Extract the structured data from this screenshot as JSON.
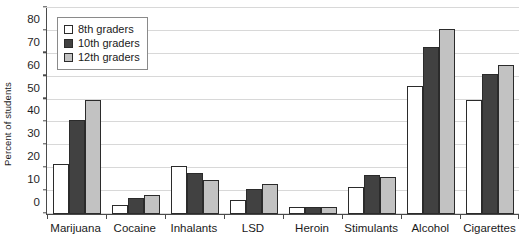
{
  "chart_data": {
    "type": "bar",
    "title": "",
    "xlabel": "",
    "ylabel": "Percent of students",
    "ylim": [
      0,
      90
    ],
    "yticks": [
      0,
      10,
      20,
      30,
      40,
      50,
      60,
      70,
      80,
      90
    ],
    "grid": true,
    "legend_position": "top-left",
    "categories": [
      "Marijuana",
      "Cocaine",
      "Inhalants",
      "LSD",
      "Heroin",
      "Stimulants",
      "Alcohol",
      "Cigarettes"
    ],
    "series": [
      {
        "name": "8th graders",
        "color": "#ffffff",
        "values": [
          22,
          4,
          21,
          6,
          3,
          12,
          56,
          50
        ]
      },
      {
        "name": "10th graders",
        "color": "#414141",
        "values": [
          41,
          7,
          18,
          11,
          3,
          17,
          73,
          61
        ]
      },
      {
        "name": "12th graders",
        "color": "#c2c2c2",
        "values": [
          50,
          8.5,
          15,
          13,
          3,
          16,
          81,
          65
        ]
      }
    ]
  },
  "colors": {
    "axis": "#4a4a4a",
    "gridline": "#d8d8d8",
    "bar_outline": "#2b2b2b",
    "text": "#1a1a1a",
    "background": "#ffffff"
  }
}
